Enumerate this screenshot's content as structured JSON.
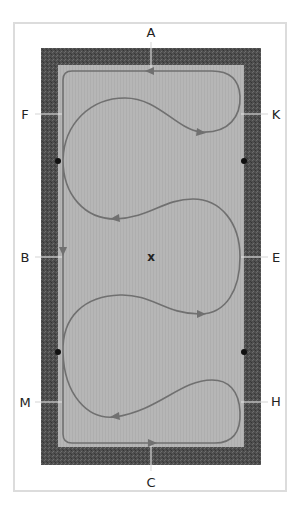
{
  "diagram": {
    "type": "dressage arena movement diagram",
    "letters": {
      "top": "A",
      "bottom": "C",
      "left_upper": "F",
      "left_middle": "B",
      "left_lower": "M",
      "right_upper": "K",
      "right_middle": "E",
      "right_lower": "H"
    },
    "center_mark": "x",
    "markers": [
      "left-upper-dot",
      "left-lower-dot",
      "right-upper-dot",
      "right-lower-dot"
    ],
    "colors": {
      "border_fill": "#505050",
      "arena_fill": "#b5b5b5",
      "track_stroke": "#707070",
      "dot": "#111111",
      "label_text": "#222222",
      "frame": "#dcdcdc"
    },
    "track_direction_arrows": [
      {
        "at": "A",
        "direction": "left"
      },
      {
        "at": "B",
        "direction": "down"
      },
      {
        "at": "C",
        "direction": "right"
      },
      {
        "at": "upper-right loop exit",
        "direction": "right"
      },
      {
        "at": "upper-left loop entry",
        "direction": "left"
      },
      {
        "at": "lower-right loop entry",
        "direction": "right"
      },
      {
        "at": "lower-left loop entry",
        "direction": "left"
      }
    ]
  }
}
